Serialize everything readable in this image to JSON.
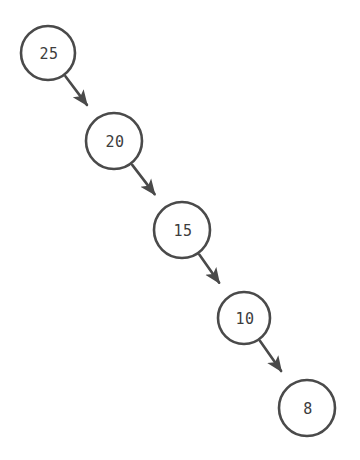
{
  "diagram": {
    "type": "directed-graph",
    "title": "",
    "background_color": "#ffffff",
    "canvas": {
      "width": 360,
      "height": 460
    },
    "style": {
      "node_stroke_color": "#4a4a4a",
      "node_fill_color": "#ffffff",
      "node_stroke_width": 2.6,
      "label_color": "#3d3d3d",
      "label_font_size": 15,
      "edge_color": "#4a4a4a",
      "edge_stroke_width": 2.6,
      "arrowhead_color": "#4a4a4a"
    },
    "nodes": [
      {
        "id": "n1",
        "label": "25",
        "cx": 48,
        "cy": 53,
        "r": 27
      },
      {
        "id": "n2",
        "label": "20",
        "cx": 114,
        "cy": 141,
        "r": 28
      },
      {
        "id": "n3",
        "label": "15",
        "cx": 182,
        "cy": 230,
        "r": 28
      },
      {
        "id": "n4",
        "label": "10",
        "cx": 244,
        "cy": 318,
        "r": 26
      },
      {
        "id": "n5",
        "label": "8",
        "cx": 307,
        "cy": 408,
        "r": 28
      }
    ],
    "edges": [
      {
        "id": "e1",
        "from": "n1",
        "to": "n2",
        "label": "",
        "directed": true
      },
      {
        "id": "e2",
        "from": "n2",
        "to": "n3",
        "label": "",
        "directed": true
      },
      {
        "id": "e3",
        "from": "n3",
        "to": "n4",
        "label": "",
        "directed": true
      },
      {
        "id": "e4",
        "from": "n4",
        "to": "n5",
        "label": "",
        "directed": true
      }
    ]
  }
}
